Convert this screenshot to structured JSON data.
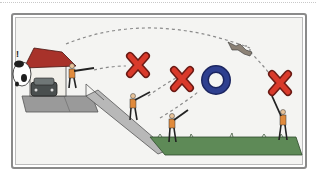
{
  "illustration": {
    "subject": "clay target shooting scene",
    "elements": {
      "trap_house": {
        "roof_color": "#a8322a",
        "wall_color": "#f2f0ea"
      },
      "cow": {
        "alert_mark": "!"
      },
      "car": {
        "color": "#4a4f4f"
      },
      "shooters": 4,
      "markers": [
        {
          "type": "X",
          "color": "#d93a2b"
        },
        {
          "type": "X",
          "color": "#d93a2b"
        },
        {
          "type": "O",
          "color": "#2e3f8f"
        },
        {
          "type": "X",
          "color": "#d93a2b"
        }
      ],
      "clay_target": "broken-clay",
      "ground": {
        "pad_color": "#8f8f8f",
        "grass_color": "#5e8a57"
      }
    },
    "colors": {
      "frame": "#8a8a8a",
      "background": "#f4f4f2",
      "trajectory": "#8a8a8a"
    }
  }
}
